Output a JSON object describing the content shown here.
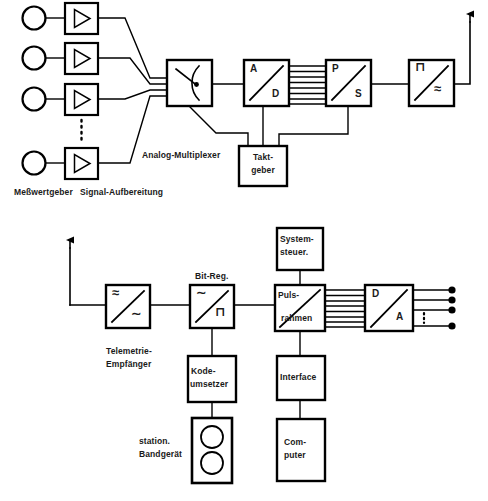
{
  "figure": {
    "language": "de",
    "line_color": "#000000",
    "background": "#ffffff"
  },
  "top_chain": {
    "name": "Sendeseite (Bordanlage)",
    "sensors": {
      "label": "Meßwertgeber",
      "count": 4,
      "symbol": "circle"
    },
    "amplifiers": {
      "label": "Signal-Aufbereitung",
      "count": 4,
      "symbol": "triangle-amplifier-icon",
      "gap_marker": "vertical-dots"
    },
    "multiplexer": {
      "label": "Analog-Multiplexer",
      "symbol": "rotary-switch-icon"
    },
    "adc": {
      "top_letter": "A",
      "bottom_letter": "D",
      "symbol": "diagonal-converter"
    },
    "bus_1": {
      "lines": 8,
      "type": "parallel-bus"
    },
    "parallel_serial": {
      "top_letter": "P",
      "bottom_letter": "S",
      "symbol": "diagonal-converter"
    },
    "modulator": {
      "top_symbol": "⊓",
      "bottom_symbol": "≈",
      "symbol": "pulse-to-carrier-converter"
    },
    "clock": {
      "line1": "Takt-",
      "line2": "geber"
    },
    "antenna_out": {
      "symbol": "arrow-up"
    }
  },
  "bottom_chain": {
    "name": "Empfangsseite (Bodenstation)",
    "antenna_in": {
      "symbol": "arrow-up"
    },
    "receiver": {
      "line1": "Telemetrie-",
      "line2": "Empfänger",
      "top_symbol": "≈",
      "bottom_symbol": "∼",
      "symbol": "diagonal-converter"
    },
    "bit_regenerator": {
      "label": "Bit-Reg.",
      "top_symbol": "∼",
      "bottom_symbol": "⊓",
      "symbol": "diagonal-converter"
    },
    "code_converter": {
      "line1": "Kode-",
      "line2": "umsetzer"
    },
    "tape_unit": {
      "line1": "station.",
      "line2": "Bandgerät",
      "symbol": "tape-reel-icon",
      "reels": 2
    },
    "system_control": {
      "line1": "System-",
      "line2": "steuer."
    },
    "frame_sync": {
      "line1": "Puls-",
      "line2": "rahmen",
      "symbol": "diagonal-converter"
    },
    "interface": {
      "label": "Interface"
    },
    "computer": {
      "line1": "Com-",
      "line2": "puter"
    },
    "bus_2": {
      "lines": 8,
      "type": "parallel-bus"
    },
    "dac": {
      "top_letter": "D",
      "bottom_letter": "A",
      "symbol": "diagonal-converter"
    },
    "outputs": {
      "count": 4,
      "terminal_symbol": "filled-dot",
      "gap_marker": "vertical-dots"
    }
  }
}
